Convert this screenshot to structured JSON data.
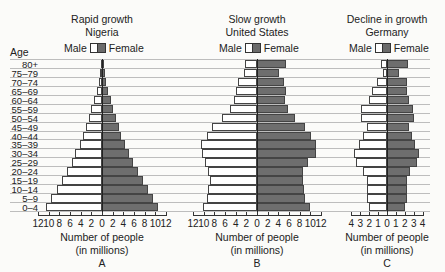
{
  "chart_data": [
    {
      "type": "bar",
      "orientation": "horizontal-population-pyramid",
      "title": "Rapid growth",
      "subtitle": "Nigeria",
      "panel_label": "A",
      "xlabel": "Number of people (in millions)",
      "ylabel": "Age",
      "xlim": [
        -12,
        12
      ],
      "xticks": [
        12,
        10,
        8,
        6,
        4,
        2,
        0,
        2,
        4,
        6,
        8,
        10,
        12
      ],
      "legend": [
        "Male",
        "Female"
      ],
      "categories": [
        "80+",
        "75–79",
        "70–74",
        "65–69",
        "60–64",
        "55–59",
        "50–54",
        "45–49",
        "40–44",
        "35–39",
        "30–34",
        "25–29",
        "20–24",
        "15–19",
        "10–14",
        "5–9",
        "0–4"
      ],
      "series": [
        {
          "name": "Male",
          "values": [
            0.2,
            0.4,
            0.6,
            1.0,
            1.5,
            2.0,
            2.5,
            3.0,
            3.5,
            4.2,
            5.0,
            5.7,
            6.6,
            7.5,
            8.5,
            9.5,
            10.5
          ]
        },
        {
          "name": "Female",
          "values": [
            0.3,
            0.5,
            0.8,
            1.1,
            1.6,
            2.1,
            2.6,
            3.1,
            3.6,
            4.3,
            5.1,
            5.8,
            6.7,
            7.6,
            8.6,
            9.6,
            10.6
          ]
        }
      ],
      "grid": true
    },
    {
      "type": "bar",
      "orientation": "horizontal-population-pyramid",
      "title": "Slow growth",
      "subtitle": "United States",
      "panel_label": "B",
      "xlabel": "Number of people (in millions)",
      "ylabel": "Age",
      "xlim": [
        -12,
        12
      ],
      "xticks": [
        12,
        10,
        8,
        6,
        4,
        2,
        0,
        2,
        4,
        6,
        8,
        10,
        12
      ],
      "legend": [
        "Male",
        "Female"
      ],
      "categories": [
        "80+",
        "75–79",
        "70–74",
        "65–69",
        "60–64",
        "55–59",
        "50–54",
        "45–49",
        "40–44",
        "35–39",
        "30–34",
        "25–29",
        "20–24",
        "15–19",
        "10–14",
        "5–9",
        "0–4"
      ],
      "series": [
        {
          "name": "Male",
          "values": [
            2.3,
            2.4,
            3.5,
            4.0,
            4.3,
            5.0,
            6.5,
            8.4,
            9.4,
            10.6,
            10.4,
            9.8,
            9.1,
            8.9,
            9.2,
            9.3,
            10.2
          ]
        },
        {
          "name": "Female",
          "values": [
            5.5,
            4.1,
            5.1,
            5.4,
            5.3,
            5.8,
            7.1,
            9.0,
            10.2,
            11.1,
            11.0,
            9.5,
            8.6,
            8.6,
            8.9,
            9.0,
            10.0
          ]
        }
      ],
      "grid": true
    },
    {
      "type": "bar",
      "orientation": "horizontal-population-pyramid",
      "title": "Decline in growth",
      "subtitle": "Germany",
      "panel_label": "C",
      "xlabel": "Number of people (in millions)",
      "ylabel": "Age",
      "xlim": [
        -4,
        4
      ],
      "xticks": [
        4,
        3,
        2,
        1,
        0,
        1,
        2,
        3,
        4
      ],
      "legend": [
        "Male",
        "Female"
      ],
      "categories": [
        "80+",
        "75–79",
        "70–74",
        "65–69",
        "60–64",
        "55–59",
        "50–54",
        "45–49",
        "40–44",
        "35–39",
        "30–34",
        "25–29",
        "20–24",
        "15–19",
        "10–14",
        "5–9",
        "0–4"
      ],
      "series": [
        {
          "name": "Male",
          "values": [
            0.7,
            0.4,
            1.1,
            1.7,
            2.0,
            2.9,
            2.9,
            2.2,
            2.7,
            3.2,
            3.7,
            3.5,
            2.7,
            2.2,
            2.2,
            2.3,
            2.0
          ]
        },
        {
          "name": "Female",
          "values": [
            2.4,
            1.4,
            2.3,
            2.3,
            2.5,
            2.9,
            3.0,
            2.5,
            2.8,
            3.2,
            3.6,
            3.4,
            2.6,
            2.3,
            2.3,
            2.3,
            2.0
          ]
        }
      ],
      "grid": true
    }
  ],
  "labels": {
    "age_header": "Age",
    "legend_male": "Male",
    "legend_female": "Female",
    "xlabel_line1": "Number of people",
    "xlabel_line2": "(in millions)"
  },
  "colors": {
    "male_fill": "#ffffff",
    "female_fill": "#6e6e6e",
    "outline": "#444444",
    "grid": "#bdbdbd"
  }
}
